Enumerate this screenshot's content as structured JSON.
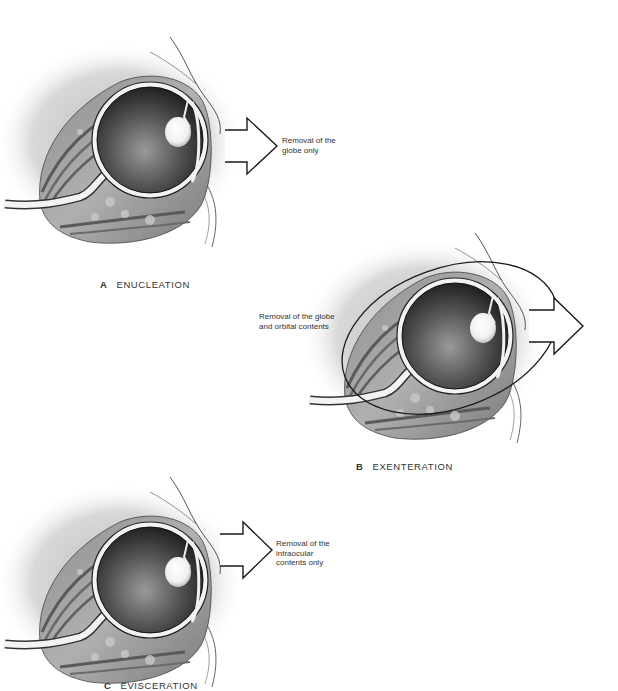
{
  "figure": {
    "panels": [
      {
        "id": "A",
        "letter": "A",
        "title": "ENUCLEATION",
        "arrow_label": "Removal of the\nglobe only"
      },
      {
        "id": "B",
        "letter": "B",
        "title": "EXENTERATION",
        "arrow_label": "Removal of the globe\nand orbital contents"
      },
      {
        "id": "C",
        "letter": "C",
        "title": "EVISCERATION",
        "arrow_label": "Removal of the\nintraocular\ncontents only"
      }
    ],
    "colors": {
      "background": "#ffffff",
      "line": "#1a1a1a",
      "shadow": "#d9d9d9",
      "tissue": "#9a9a9a",
      "globe_dark": "#3a3a3a",
      "lens": "#f4f4f4"
    }
  }
}
